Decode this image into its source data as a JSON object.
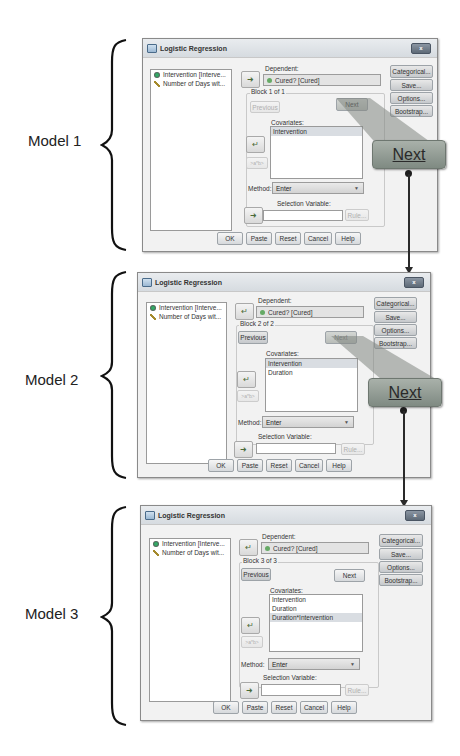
{
  "models": [
    {
      "label": "Model 1",
      "dialog": {
        "title": "Logistic Regression",
        "close_label": "x",
        "variables": [
          "Intervention [Interve...",
          "Number of Days wit..."
        ],
        "dependent_label": "Dependent:",
        "dependent_value": "Cured? [Cured]",
        "block_label": "Block 1 of 1",
        "previous_label": "Previous",
        "next_label": "Next",
        "covariates_label": "Covariates:",
        "covariates": [
          "Intervention"
        ],
        "interaction_label": ">a*b>",
        "method_label": "Method:",
        "method_value": "Enter",
        "selection_label": "Selection Variable:",
        "selection_value": "",
        "rule_label": "Rule...",
        "side_buttons": [
          "Categorical...",
          "Save...",
          "Options...",
          "Bootstrap..."
        ],
        "bottom_buttons": [
          "OK",
          "Paste",
          "Reset",
          "Cancel",
          "Help"
        ]
      },
      "callout_label": "Next"
    },
    {
      "label": "Model 2",
      "dialog": {
        "title": "Logistic Regression",
        "close_label": "x",
        "variables": [
          "Intervention [Interve...",
          "Number of Days wit..."
        ],
        "dependent_label": "Dependent:",
        "dependent_value": "Cured? [Cured]",
        "block_label": "Block 2 of 2",
        "previous_label": "Previous",
        "next_label": "Next",
        "covariates_label": "Covariates:",
        "covariates": [
          "Intervention",
          "Duration"
        ],
        "interaction_label": ">a*b>",
        "method_label": "Method:",
        "method_value": "Enter",
        "selection_label": "Selection Variable:",
        "selection_value": "",
        "rule_label": "Rule...",
        "side_buttons": [
          "Categorical...",
          "Save...",
          "Options...",
          "Bootstrap..."
        ],
        "bottom_buttons": [
          "OK",
          "Paste",
          "Reset",
          "Cancel",
          "Help"
        ]
      },
      "callout_label": "Next"
    },
    {
      "label": "Model 3",
      "dialog": {
        "title": "Logistic Regression",
        "close_label": "x",
        "variables": [
          "Intervention [Interve...",
          "Number of Days wit..."
        ],
        "dependent_label": "Dependent:",
        "dependent_value": "Cured? [Cured]",
        "block_label": "Block 3 of 3",
        "previous_label": "Previous",
        "next_label": "Next",
        "covariates_label": "Covariates:",
        "covariates": [
          "Intervention",
          "Duration",
          "Duration*Intervention"
        ],
        "interaction_label": ">a*b>",
        "method_label": "Method:",
        "method_value": "Enter",
        "selection_label": "Selection Variable:",
        "selection_value": "",
        "rule_label": "Rule...",
        "side_buttons": [
          "Categorical...",
          "Save...",
          "Options...",
          "Bootstrap..."
        ],
        "bottom_buttons": [
          "OK",
          "Paste",
          "Reset",
          "Cancel",
          "Help"
        ]
      }
    }
  ]
}
